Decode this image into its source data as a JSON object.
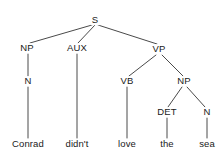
{
  "diagram": {
    "kind": "syntax-tree",
    "sentence": "Conrad didn't love the sea",
    "colors": {
      "background": "#ffffff",
      "line": "#4a4a4a",
      "text": "#1a1a1a"
    },
    "nodes": [
      {
        "id": "S",
        "label": "S",
        "x": 95,
        "y": 20
      },
      {
        "id": "NP1",
        "label": "NP",
        "x": 27,
        "y": 48
      },
      {
        "id": "AUX",
        "label": "AUX",
        "x": 77,
        "y": 48
      },
      {
        "id": "VP",
        "label": "VP",
        "x": 159,
        "y": 49
      },
      {
        "id": "N1",
        "label": "N",
        "x": 28,
        "y": 81
      },
      {
        "id": "VB",
        "label": "VB",
        "x": 127,
        "y": 81
      },
      {
        "id": "NP2",
        "label": "NP",
        "x": 184,
        "y": 81
      },
      {
        "id": "DET",
        "label": "DET",
        "x": 167,
        "y": 112
      },
      {
        "id": "N2",
        "label": "N",
        "x": 207,
        "y": 112
      }
    ],
    "leaves": [
      {
        "id": "leaf-conrad",
        "label": "Conrad",
        "x": 28,
        "y": 144
      },
      {
        "id": "leaf-didnt",
        "label": "didn't",
        "x": 77,
        "y": 144
      },
      {
        "id": "leaf-love",
        "label": "love",
        "x": 127,
        "y": 144
      },
      {
        "id": "leaf-the",
        "label": "the",
        "x": 167,
        "y": 144
      },
      {
        "id": "leaf-sea",
        "label": "sea",
        "x": 207,
        "y": 144
      }
    ],
    "edges": [
      {
        "id": "edge-s-np1",
        "from": "S",
        "to": "NP1",
        "x1": 92,
        "y1": 25,
        "x2": 30,
        "y2": 43
      },
      {
        "id": "edge-s-aux",
        "from": "S",
        "to": "AUX",
        "x1": 95,
        "y1": 25,
        "x2": 78,
        "y2": 43
      },
      {
        "id": "edge-s-vp",
        "from": "S",
        "to": "VP",
        "x1": 98,
        "y1": 25,
        "x2": 157,
        "y2": 44
      },
      {
        "id": "edge-np1-n1",
        "from": "NP1",
        "to": "N1",
        "x1": 28,
        "y1": 54,
        "x2": 28,
        "y2": 76
      },
      {
        "id": "edge-n1-conrad",
        "from": "N1",
        "to": "leaf-conrad",
        "x1": 28,
        "y1": 87,
        "x2": 28,
        "y2": 138
      },
      {
        "id": "edge-aux-didnt",
        "from": "AUX",
        "to": "leaf-didnt",
        "x1": 77,
        "y1": 54,
        "x2": 77,
        "y2": 138
      },
      {
        "id": "edge-vp-vb",
        "from": "VP",
        "to": "VB",
        "x1": 156,
        "y1": 55,
        "x2": 129,
        "y2": 76
      },
      {
        "id": "edge-vp-np2",
        "from": "VP",
        "to": "NP2",
        "x1": 162,
        "y1": 55,
        "x2": 183,
        "y2": 76
      },
      {
        "id": "edge-vb-love",
        "from": "VB",
        "to": "leaf-love",
        "x1": 127,
        "y1": 87,
        "x2": 127,
        "y2": 138
      },
      {
        "id": "edge-np2-det",
        "from": "NP2",
        "to": "DET",
        "x1": 182,
        "y1": 87,
        "x2": 168,
        "y2": 107
      },
      {
        "id": "edge-np2-n2",
        "from": "NP2",
        "to": "N2",
        "x1": 187,
        "y1": 87,
        "x2": 205,
        "y2": 107
      },
      {
        "id": "edge-det-the",
        "from": "DET",
        "to": "leaf-the",
        "x1": 167,
        "y1": 118,
        "x2": 167,
        "y2": 138
      },
      {
        "id": "edge-n2-sea",
        "from": "N2",
        "to": "leaf-sea",
        "x1": 207,
        "y1": 118,
        "x2": 207,
        "y2": 138
      }
    ]
  }
}
